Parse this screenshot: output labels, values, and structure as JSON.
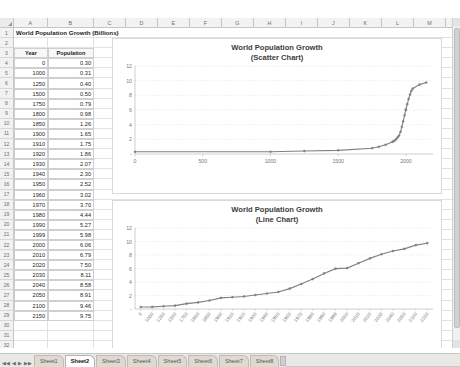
{
  "spreadsheet": {
    "columns": [
      "A",
      "B",
      "C",
      "D",
      "E",
      "F",
      "G",
      "H",
      "I",
      "J",
      "K",
      "L",
      "M"
    ],
    "title_cell": "World Population Growth (Billions)",
    "header_year": "Year",
    "header_population": "Population",
    "rows": [
      {
        "n": "1",
        "a": "",
        "b": ""
      },
      {
        "n": "2",
        "a": "",
        "b": ""
      },
      {
        "n": "3",
        "a": "Year",
        "b": "Population"
      },
      {
        "n": "4",
        "a": "0",
        "b": "0.30"
      },
      {
        "n": "5",
        "a": "1000",
        "b": "0.31"
      },
      {
        "n": "6",
        "a": "1250",
        "b": "0.40"
      },
      {
        "n": "7",
        "a": "1500",
        "b": "0.50"
      },
      {
        "n": "8",
        "a": "1750",
        "b": "0.79"
      },
      {
        "n": "9",
        "a": "1800",
        "b": "0.98"
      },
      {
        "n": "10",
        "a": "1850",
        "b": "1.26"
      },
      {
        "n": "11",
        "a": "1900",
        "b": "1.65"
      },
      {
        "n": "12",
        "a": "1910",
        "b": "1.75"
      },
      {
        "n": "13",
        "a": "1920",
        "b": "1.86"
      },
      {
        "n": "14",
        "a": "1930",
        "b": "2.07"
      },
      {
        "n": "15",
        "a": "1940",
        "b": "2.30"
      },
      {
        "n": "16",
        "a": "1950",
        "b": "2.52"
      },
      {
        "n": "17",
        "a": "1960",
        "b": "3.02"
      },
      {
        "n": "18",
        "a": "1970",
        "b": "3.70"
      },
      {
        "n": "19",
        "a": "1980",
        "b": "4.44"
      },
      {
        "n": "20",
        "a": "1990",
        "b": "5.27"
      },
      {
        "n": "21",
        "a": "1999",
        "b": "5.98"
      },
      {
        "n": "22",
        "a": "2000",
        "b": "6.06"
      },
      {
        "n": "23",
        "a": "2010",
        "b": "6.79"
      },
      {
        "n": "24",
        "a": "2020",
        "b": "7.50"
      },
      {
        "n": "25",
        "a": "2030",
        "b": "8.11"
      },
      {
        "n": "26",
        "a": "2040",
        "b": "8.58"
      },
      {
        "n": "27",
        "a": "2050",
        "b": "8.91"
      },
      {
        "n": "28",
        "a": "2100",
        "b": "9.46"
      },
      {
        "n": "29",
        "a": "2150",
        "b": "9.75"
      },
      {
        "n": "30",
        "a": "",
        "b": ""
      },
      {
        "n": "31",
        "a": "",
        "b": ""
      },
      {
        "n": "32",
        "a": "",
        "b": ""
      },
      {
        "n": "33",
        "a": "",
        "b": ""
      }
    ]
  },
  "tabs": {
    "nav_first": "◀◀",
    "nav_prev": "◀",
    "nav_next": "▶",
    "nav_last": "▶▶",
    "items": [
      {
        "label": "Sheet1",
        "active": false
      },
      {
        "label": "Sheet2",
        "active": true
      },
      {
        "label": "Sheet3",
        "active": false
      },
      {
        "label": "Sheet4",
        "active": false
      },
      {
        "label": "Sheet5",
        "active": false
      },
      {
        "label": "Sheet6",
        "active": false
      },
      {
        "label": "Sheet7",
        "active": false
      },
      {
        "label": "Sheet8",
        "active": false
      }
    ]
  },
  "charts": {
    "scatter": {
      "title": "World Population Growth",
      "subtitle": "(Scatter Chart)"
    },
    "line": {
      "title": "World Population Growth",
      "subtitle": "(Line Chart)"
    }
  },
  "chart_data": [
    {
      "type": "scatter",
      "title": "World Population Growth",
      "subtitle": "(Scatter Chart)",
      "xlabel": "",
      "ylabel": "",
      "xlim": [
        0,
        2200
      ],
      "ylim": [
        0,
        12
      ],
      "xticks": [
        0,
        500,
        1000,
        1500,
        2000
      ],
      "yticks": [
        "-",
        2,
        4,
        6,
        8,
        10,
        12
      ],
      "grid": true,
      "legend": false,
      "marker": "circle",
      "series_color": "#808080",
      "x": [
        0,
        1000,
        1250,
        1500,
        1750,
        1800,
        1850,
        1900,
        1910,
        1920,
        1930,
        1940,
        1950,
        1960,
        1970,
        1980,
        1990,
        1999,
        2000,
        2010,
        2020,
        2030,
        2040,
        2050,
        2100,
        2150
      ],
      "y": [
        0.3,
        0.31,
        0.4,
        0.5,
        0.79,
        0.98,
        1.26,
        1.65,
        1.75,
        1.86,
        2.07,
        2.3,
        2.52,
        3.02,
        3.7,
        4.44,
        5.27,
        5.98,
        6.06,
        6.79,
        7.5,
        8.11,
        8.58,
        8.91,
        9.46,
        9.75
      ]
    },
    {
      "type": "line",
      "title": "World Population Growth",
      "subtitle": "(Line Chart)",
      "xlabel": "",
      "ylabel": "",
      "ylim": [
        0,
        12
      ],
      "yticks": [
        "-",
        2,
        4,
        6,
        8,
        10,
        12
      ],
      "grid": true,
      "legend": false,
      "marker": "circle",
      "series_color": "#808080",
      "categories": [
        "0",
        "1000",
        "1250",
        "1500",
        "1750",
        "1800",
        "1850",
        "1900",
        "1910",
        "1920",
        "1930",
        "1940",
        "1950",
        "1960",
        "1970",
        "1980",
        "1990",
        "1999",
        "2000",
        "2010",
        "2020",
        "2030",
        "2040",
        "2050",
        "2100",
        "2150"
      ],
      "values": [
        0.3,
        0.31,
        0.4,
        0.5,
        0.79,
        0.98,
        1.26,
        1.65,
        1.75,
        1.86,
        2.07,
        2.3,
        2.52,
        3.02,
        3.7,
        4.44,
        5.27,
        5.98,
        6.06,
        6.79,
        7.5,
        8.11,
        8.58,
        8.91,
        9.46,
        9.75
      ]
    }
  ]
}
